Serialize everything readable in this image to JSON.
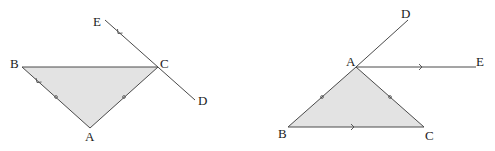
{
  "colors": {
    "line": "#4a4a4a",
    "fill": "#e3e3e3",
    "text": "#222222"
  },
  "figures": [
    {
      "id": "left",
      "description": "Isosceles triangle ABC with AB = AC, line ED through C parallel to AB",
      "points": {
        "A": {
          "label": "A",
          "x": 90,
          "y": 128
        },
        "B": {
          "label": "B",
          "x": 22,
          "y": 67
        },
        "C": {
          "label": "C",
          "x": 158,
          "y": 67
        },
        "D": {
          "label": "D",
          "x": 195,
          "y": 101
        },
        "E": {
          "label": "E",
          "x": 105,
          "y": 20
        }
      },
      "equal_sides": [
        "AB",
        "AC"
      ],
      "parallel_marks": [
        "BA",
        "EC"
      ]
    },
    {
      "id": "right",
      "description": "Isosceles triangle ABC with AB = AC, ray AE parallel to BC, BA extended to D",
      "points": {
        "A": {
          "label": "A",
          "x": 356,
          "y": 67
        },
        "B": {
          "label": "B",
          "x": 288,
          "y": 127
        },
        "C": {
          "label": "C",
          "x": 424,
          "y": 127
        },
        "D": {
          "label": "D",
          "x": 408,
          "y": 20
        },
        "E": {
          "label": "E",
          "x": 476,
          "y": 67
        }
      },
      "equal_sides": [
        "AB",
        "AC"
      ],
      "parallel_marks": [
        "AE",
        "BC"
      ]
    }
  ],
  "labels": {
    "left": {
      "A": "A",
      "B": "B",
      "C": "C",
      "D": "D",
      "E": "E"
    },
    "right": {
      "A": "A",
      "B": "B",
      "C": "C",
      "D": "D",
      "E": "E"
    }
  }
}
